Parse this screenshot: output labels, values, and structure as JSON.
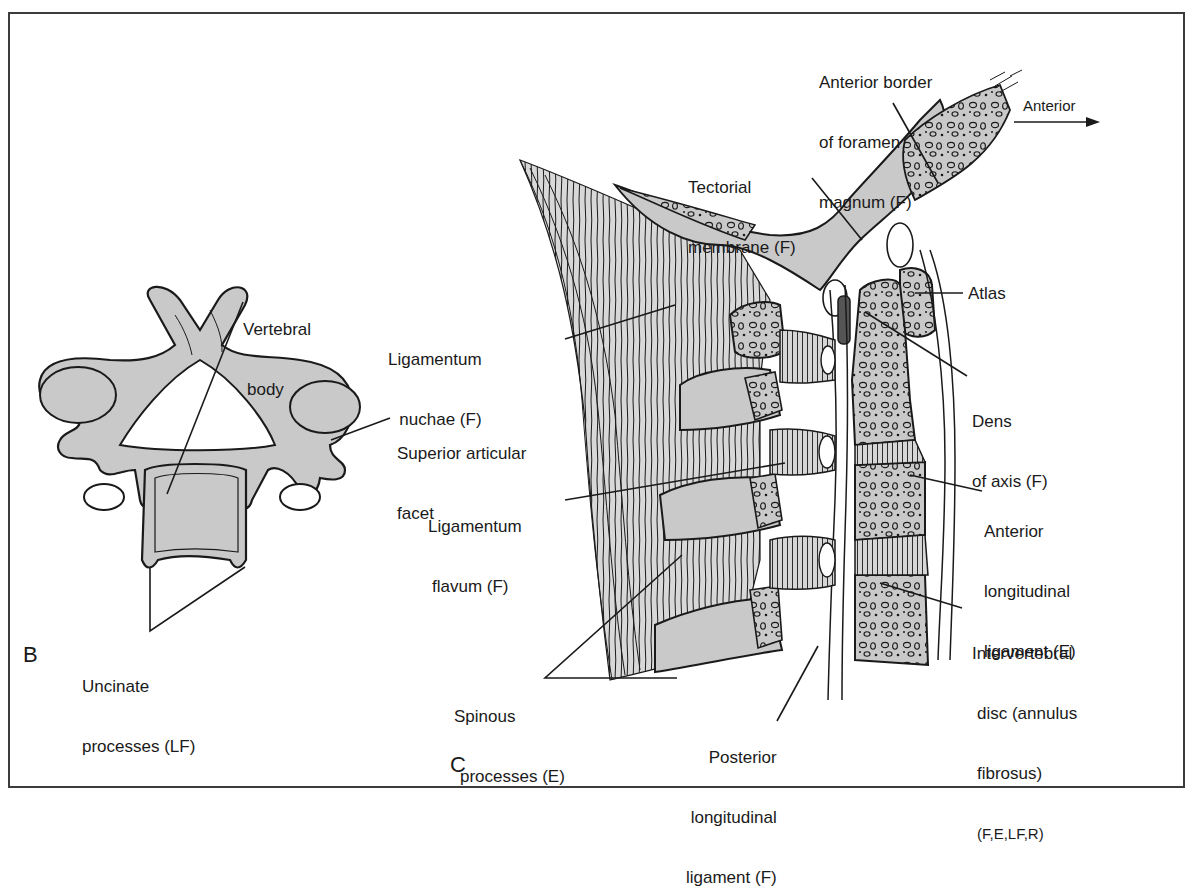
{
  "figure": {
    "panels": [
      {
        "id": "B",
        "letter": "B",
        "view": "superior view of cervical vertebra",
        "labels": {
          "vertebral_body": [
            "Vertebral",
            "body"
          ],
          "superior_articular_facet": [
            "Superior articular",
            "facet"
          ],
          "uncinate_processes": [
            "Uncinate",
            "processes (LF)"
          ]
        }
      },
      {
        "id": "C",
        "letter": "C",
        "view": "sagittal section of upper cervical spine",
        "direction": {
          "label": "Anterior",
          "arrow": "right-arrow"
        },
        "labels": {
          "anterior_border_foramen_magnum": [
            "Anterior border",
            "of foramen",
            "magnum (F)"
          ],
          "tectorial_membrane": [
            "Tectorial",
            "membrane (F)"
          ],
          "atlas": [
            "Atlas"
          ],
          "ligamentum_nuchae": [
            "Ligamentum",
            "nuchae (F)"
          ],
          "dens_of_axis": [
            "Dens",
            "of axis (F)"
          ],
          "ligamentum_flavum": [
            "Ligamentum",
            "flavum (F)"
          ],
          "anterior_longitudinal_ligament": [
            "Anterior",
            "longitudinal",
            "ligament (E)"
          ],
          "intervertebral_disc": [
            "Intervertebral",
            "disc (annulus",
            "fibrosus)",
            "(F,E,LF,R)"
          ],
          "spinous_processes": [
            "Spinous",
            "processes (E)"
          ],
          "posterior_longitudinal_ligament": [
            "Posterior",
            "longitudinal",
            "ligament (F)"
          ]
        }
      }
    ],
    "colors": {
      "bone_fill": "#c9c9c9",
      "line": "#1a1a1a",
      "frame": "#3c3c3c",
      "background": "#ffffff"
    }
  }
}
